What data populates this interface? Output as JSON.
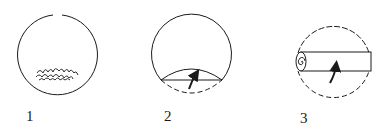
{
  "diagram": {
    "type": "step-sequence",
    "colors": {
      "stroke": "#1a1a1a",
      "background": "#ffffff"
    },
    "steps": [
      {
        "label": "1",
        "depiction": "circle with filling placed near bottom edge"
      },
      {
        "label": "2",
        "depiction": "bottom segment folded up over filling, arrow indicating fold"
      },
      {
        "label": "3",
        "depiction": "folded edge rolled into a tube across the circle, arrow indicating roll"
      }
    ]
  }
}
